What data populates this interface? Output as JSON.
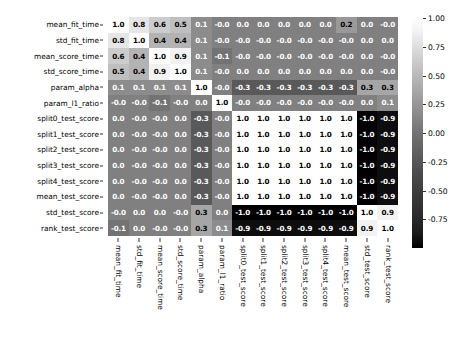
{
  "chart_data": {
    "type": "heatmap",
    "title": "",
    "xlabel": "",
    "ylabel": "",
    "grid": false,
    "colormap": "gray",
    "annotated": true,
    "categories": [
      "mean_fit_time",
      "std_fit_time",
      "mean_score_time",
      "std_score_time",
      "param_alpha",
      "param_l1_ratio",
      "split0_test_score",
      "split1_test_score",
      "split2_test_score",
      "split3_test_score",
      "split4_test_score",
      "mean_test_score",
      "std_test_score",
      "rank_test_score"
    ],
    "x_tick_labels": [
      "mean_fit_time",
      "std_fit_time",
      "mean_score_time",
      "std_score_time",
      "param_alpha",
      "param_l1_ratio",
      "split0_test_score",
      "split1_test_score",
      "split2_test_score",
      "split3_test_score",
      "split4_test_score",
      "mean_test_score",
      "std_test_score",
      "rank_test_score"
    ],
    "y_tick_labels": [
      "mean_fit_time",
      "std_fit_time",
      "mean_score_time",
      "std_score_time",
      "param_alpha",
      "param_l1_ratio",
      "split0_test_score",
      "split1_test_score",
      "split2_test_score",
      "split3_test_score",
      "split4_test_score",
      "mean_test_score",
      "std_test_score",
      "rank_test_score"
    ],
    "zlim": [
      -1.0,
      1.0
    ],
    "values": [
      [
        1.0,
        0.8,
        0.6,
        0.5,
        0.1,
        -0.0,
        0.0,
        0.0,
        0.0,
        0.0,
        0.0,
        0.2,
        0.0,
        -0.0
      ],
      [
        0.8,
        1.0,
        0.4,
        0.4,
        0.1,
        -0.0,
        -0.0,
        -0.0,
        -0.0,
        -0.0,
        -0.0,
        -0.0,
        0.0,
        0.0
      ],
      [
        0.6,
        0.4,
        1.0,
        0.9,
        0.1,
        -0.1,
        -0.0,
        -0.0,
        -0.0,
        -0.0,
        -0.0,
        -0.0,
        0.0,
        -0.0
      ],
      [
        0.5,
        0.4,
        0.9,
        1.0,
        0.1,
        -0.0,
        0.0,
        0.0,
        0.0,
        0.0,
        0.0,
        0.0,
        0.0,
        -0.0
      ],
      [
        0.1,
        0.1,
        0.1,
        0.1,
        1.0,
        -0.0,
        -0.3,
        -0.3,
        -0.3,
        -0.3,
        -0.3,
        -0.3,
        0.3,
        0.3
      ],
      [
        -0.0,
        -0.0,
        -0.1,
        -0.0,
        0.0,
        1.0,
        -0.0,
        -0.0,
        -0.0,
        -0.0,
        -0.0,
        -0.0,
        0.0,
        0.1
      ],
      [
        0.0,
        -0.0,
        -0.0,
        0.0,
        -0.3,
        -0.0,
        1.0,
        1.0,
        1.0,
        1.0,
        1.0,
        1.0,
        -1.0,
        -0.9
      ],
      [
        0.0,
        -0.0,
        -0.0,
        0.0,
        -0.3,
        -0.0,
        1.0,
        1.0,
        1.0,
        1.0,
        1.0,
        1.0,
        -1.0,
        -0.9
      ],
      [
        0.0,
        -0.0,
        -0.0,
        0.0,
        -0.3,
        -0.0,
        1.0,
        1.0,
        1.0,
        1.0,
        1.0,
        1.0,
        -1.0,
        -0.9
      ],
      [
        0.0,
        -0.0,
        -0.0,
        0.0,
        -0.3,
        -0.0,
        1.0,
        1.0,
        1.0,
        1.0,
        1.0,
        1.0,
        -1.0,
        -0.9
      ],
      [
        0.0,
        -0.0,
        -0.0,
        0.0,
        -0.3,
        -0.0,
        1.0,
        1.0,
        1.0,
        1.0,
        1.0,
        1.0,
        -1.0,
        -0.9
      ],
      [
        0.0,
        -0.0,
        -0.0,
        0.0,
        -0.3,
        -0.0,
        1.0,
        1.0,
        1.0,
        1.0,
        1.0,
        1.0,
        -1.0,
        -0.9
      ],
      [
        -0.0,
        0.0,
        0.0,
        -0.0,
        0.3,
        0.0,
        -1.0,
        -1.0,
        -1.0,
        -1.0,
        -1.0,
        -1.0,
        1.0,
        0.9
      ],
      [
        -0.1,
        0.0,
        -0.0,
        -0.0,
        0.3,
        0.1,
        -0.9,
        -0.9,
        -0.9,
        -0.9,
        -0.9,
        -0.9,
        0.9,
        1.0
      ]
    ],
    "value_labels": [
      [
        "1.0",
        "0.8",
        "0.6",
        "0.5",
        "0.1",
        "-0.0",
        "0.0",
        "0.0",
        "0.0",
        "0.0",
        "0.0",
        "0.2",
        "0.0",
        "-0.0"
      ],
      [
        "0.8",
        "1.0",
        "0.4",
        "0.4",
        "0.1",
        "-0.0",
        "-0.0",
        "-0.0",
        "-0.0",
        "-0.0",
        "-0.0",
        "-0.0",
        "0.0",
        "0.0"
      ],
      [
        "0.6",
        "0.4",
        "1.0",
        "0.9",
        "0.1",
        "-0.1",
        "-0.0",
        "-0.0",
        "-0.0",
        "-0.0",
        "-0.0",
        "-0.0",
        "0.0",
        "-0.0"
      ],
      [
        "0.5",
        "0.4",
        "0.9",
        "1.0",
        "0.1",
        "-0.0",
        "0.0",
        "0.0",
        "0.0",
        "0.0",
        "0.0",
        "0.0",
        "0.0",
        "-0.0"
      ],
      [
        "0.1",
        "0.1",
        "0.1",
        "0.1",
        "1.0",
        "-0.0",
        "-0.3",
        "-0.3",
        "-0.3",
        "-0.3",
        "-0.3",
        "-0.3",
        "0.3",
        "0.3"
      ],
      [
        "-0.0",
        "-0.0",
        "-0.1",
        "-0.0",
        "0.0",
        "1.0",
        "-0.0",
        "-0.0",
        "-0.0",
        "-0.0",
        "-0.0",
        "-0.0",
        "0.0",
        "0.1"
      ],
      [
        "0.0",
        "-0.0",
        "-0.0",
        "0.0",
        "-0.3",
        "-0.0",
        "1.0",
        "1.0",
        "1.0",
        "1.0",
        "1.0",
        "1.0",
        "-1.0",
        "-0.9"
      ],
      [
        "0.0",
        "-0.0",
        "-0.0",
        "0.0",
        "-0.3",
        "-0.0",
        "1.0",
        "1.0",
        "1.0",
        "1.0",
        "1.0",
        "1.0",
        "-1.0",
        "-0.9"
      ],
      [
        "0.0",
        "-0.0",
        "-0.0",
        "0.0",
        "-0.3",
        "-0.0",
        "1.0",
        "1.0",
        "1.0",
        "1.0",
        "1.0",
        "1.0",
        "-1.0",
        "-0.9"
      ],
      [
        "0.0",
        "-0.0",
        "-0.0",
        "0.0",
        "-0.3",
        "-0.0",
        "1.0",
        "1.0",
        "1.0",
        "1.0",
        "1.0",
        "1.0",
        "-1.0",
        "-0.9"
      ],
      [
        "0.0",
        "-0.0",
        "-0.0",
        "0.0",
        "-0.3",
        "-0.0",
        "1.0",
        "1.0",
        "1.0",
        "1.0",
        "1.0",
        "1.0",
        "-1.0",
        "-0.9"
      ],
      [
        "0.0",
        "-0.0",
        "-0.0",
        "0.0",
        "-0.3",
        "-0.0",
        "1.0",
        "1.0",
        "1.0",
        "1.0",
        "1.0",
        "1.0",
        "-1.0",
        "-0.9"
      ],
      [
        "-0.0",
        "0.0",
        "0.0",
        "-0.0",
        "0.3",
        "0.0",
        "-1.0",
        "-1.0",
        "-1.0",
        "-1.0",
        "-1.0",
        "-1.0",
        "1.0",
        "0.9"
      ],
      [
        "-0.1",
        "0.0",
        "-0.0",
        "-0.0",
        "0.3",
        "0.1",
        "-0.9",
        "-0.9",
        "-0.9",
        "-0.9",
        "-0.9",
        "-0.9",
        "0.9",
        "1.0"
      ]
    ],
    "colorbar": {
      "position": "right",
      "ticks": [
        1.0,
        0.75,
        0.5,
        0.25,
        0.0,
        -0.25,
        -0.5,
        -0.75
      ],
      "tick_labels": [
        "1.00",
        "0.75",
        "0.50",
        "0.25",
        "0.00",
        "-0.25",
        "-0.50",
        "-0.75"
      ],
      "vmin": -1.0,
      "vmax": 1.0
    }
  }
}
